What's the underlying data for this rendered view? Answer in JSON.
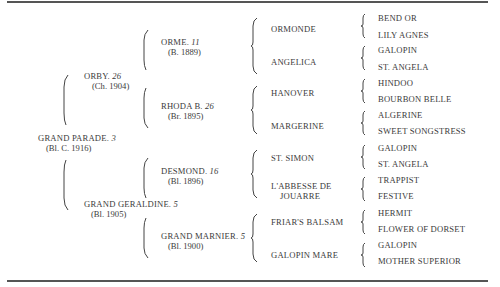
{
  "rules": {
    "top_y": 2,
    "bottom_y": 281
  },
  "generation1": {
    "name": "GRAND PARADE.",
    "family": "3",
    "detail": "(Bl. C. 1916)"
  },
  "generation2": [
    {
      "name": "ORBY.",
      "family": "26",
      "detail": "(Ch. 1904)"
    },
    {
      "name": "GRAND GERALDINE.",
      "family": "5",
      "detail": "(Bl. 1905)"
    }
  ],
  "generation3": [
    {
      "name": "ORME.",
      "family": "11",
      "detail": "(B. 1889)"
    },
    {
      "name": "RHODA B.",
      "family": "26",
      "detail": "(Br. 1895)"
    },
    {
      "name": "DESMOND.",
      "family": "16",
      "detail": "(Bl. 1896)"
    },
    {
      "name": "GRAND MARNIER.",
      "family": "5",
      "detail": "(Bl. 1900)"
    }
  ],
  "generation4": [
    {
      "name": "ORMONDE"
    },
    {
      "name": "ANGELICA"
    },
    {
      "name": "HANOVER"
    },
    {
      "name": "MARGERINE"
    },
    {
      "name": "ST. SIMON"
    },
    {
      "name": "L'ABBESSE DE",
      "name2": "JOUARRE"
    },
    {
      "name": "FRIAR'S BALSAM"
    },
    {
      "name": "GALOPIN MARE"
    }
  ],
  "generation5": [
    "BEND OR",
    "LILY AGNES",
    "GALOPIN",
    "ST. ANGELA",
    "HINDOO",
    "BOURBON BELLE",
    "ALGERINE",
    "SWEET SONGSTRESS",
    "GALOPIN",
    "ST. ANGELA",
    "TRAPPIST",
    "FESTIVE",
    "HERMIT",
    "FLOWER OF DORSET",
    "GALOPIN",
    "MOTHER SUPERIOR"
  ]
}
